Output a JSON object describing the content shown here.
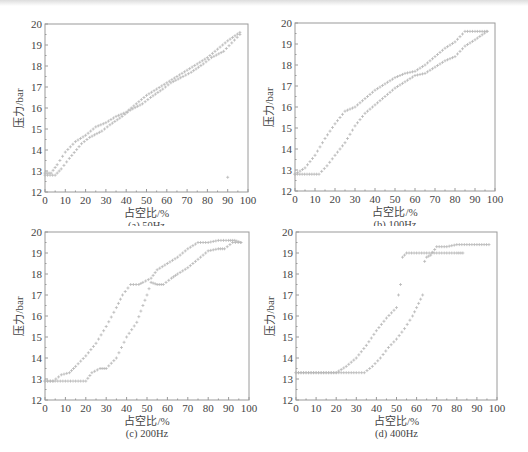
{
  "chart_data": [
    {
      "type": "scatter",
      "caption": "(a) 50Hz",
      "xlabel": "占空比/%",
      "ylabel": "压力/bar",
      "xlim": [
        0,
        100
      ],
      "ylim": [
        12,
        20
      ],
      "xticks": [
        0,
        10,
        20,
        30,
        40,
        50,
        60,
        70,
        80,
        90,
        100
      ],
      "yticks": [
        12,
        13,
        14,
        15,
        16,
        17,
        18,
        19,
        20
      ],
      "grid": false,
      "series": [
        {
          "name": "rising",
          "x": [
            0,
            3,
            6,
            10,
            15,
            20,
            25,
            30,
            35,
            40,
            45,
            50,
            55,
            60,
            65,
            70,
            75,
            80,
            85,
            90,
            96
          ],
          "y": [
            12.9,
            12.9,
            13.3,
            13.9,
            14.4,
            14.7,
            15.1,
            15.3,
            15.6,
            15.8,
            16.2,
            16.6,
            16.9,
            17.2,
            17.5,
            17.8,
            18.1,
            18.4,
            18.8,
            19.2,
            19.6
          ]
        },
        {
          "name": "falling",
          "x": [
            0,
            5,
            8,
            12,
            18,
            22,
            28,
            32,
            38,
            42,
            48,
            52,
            58,
            62,
            68,
            72,
            78,
            82,
            88,
            92,
            96
          ],
          "y": [
            12.8,
            12.8,
            13.1,
            13.6,
            14.3,
            14.6,
            14.9,
            15.2,
            15.6,
            15.9,
            16.2,
            16.5,
            16.9,
            17.2,
            17.5,
            17.7,
            18.1,
            18.4,
            18.7,
            19.1,
            19.5
          ]
        },
        {
          "name": "outlier",
          "x": [
            90
          ],
          "y": [
            12.7
          ]
        }
      ]
    },
    {
      "type": "scatter",
      "caption": "(b) 100Hz",
      "xlabel": "占空比/%",
      "ylabel": "压力/bar",
      "xlim": [
        0,
        100
      ],
      "ylim": [
        12,
        20
      ],
      "xticks": [
        0,
        10,
        20,
        30,
        40,
        50,
        60,
        70,
        80,
        90,
        100
      ],
      "yticks": [
        12,
        13,
        14,
        15,
        16,
        17,
        18,
        19,
        20
      ],
      "grid": false,
      "series": [
        {
          "name": "upper",
          "x": [
            0,
            5,
            10,
            15,
            20,
            25,
            30,
            35,
            40,
            45,
            50,
            55,
            60,
            65,
            70,
            75,
            80,
            85,
            90,
            96
          ],
          "y": [
            12.8,
            13.1,
            13.7,
            14.5,
            15.2,
            15.8,
            16.0,
            16.4,
            16.8,
            17.1,
            17.4,
            17.6,
            17.7,
            18.0,
            18.4,
            18.8,
            19.1,
            19.6,
            19.6,
            19.6
          ]
        },
        {
          "name": "lower",
          "x": [
            0,
            6,
            12,
            16,
            20,
            25,
            30,
            35,
            40,
            45,
            50,
            55,
            60,
            65,
            70,
            75,
            80,
            85,
            90,
            96
          ],
          "y": [
            12.8,
            12.8,
            12.8,
            13.2,
            13.7,
            14.3,
            15.1,
            15.7,
            16.1,
            16.5,
            16.9,
            17.2,
            17.5,
            17.6,
            17.9,
            18.2,
            18.4,
            18.9,
            19.2,
            19.6
          ]
        }
      ]
    },
    {
      "type": "scatter",
      "caption": "(c) 200Hz",
      "xlabel": "占空比/%",
      "ylabel": "压力/bar",
      "xlim": [
        0,
        100
      ],
      "ylim": [
        12,
        20
      ],
      "xticks": [
        0,
        10,
        20,
        30,
        40,
        50,
        60,
        70,
        80,
        90,
        100
      ],
      "yticks": [
        12,
        13,
        14,
        15,
        16,
        17,
        18,
        19,
        20
      ],
      "grid": false,
      "series": [
        {
          "name": "upper",
          "x": [
            0,
            4,
            8,
            12,
            15,
            20,
            25,
            30,
            35,
            38,
            42,
            46,
            48,
            52,
            55,
            60,
            65,
            70,
            75,
            80,
            85,
            90,
            93,
            96
          ],
          "y": [
            12.9,
            12.9,
            13.2,
            13.3,
            13.6,
            14.1,
            14.7,
            15.5,
            16.4,
            17.0,
            17.5,
            17.5,
            17.6,
            17.8,
            18.2,
            18.5,
            18.8,
            19.2,
            19.5,
            19.5,
            19.6,
            19.6,
            19.6,
            19.5
          ]
        },
        {
          "name": "lower",
          "x": [
            0,
            5,
            10,
            15,
            20,
            23,
            27,
            30,
            35,
            40,
            45,
            48,
            50,
            52,
            55,
            58,
            62,
            65,
            70,
            75,
            80,
            85,
            88,
            92,
            96
          ],
          "y": [
            12.9,
            12.9,
            12.9,
            12.9,
            12.9,
            13.3,
            13.5,
            13.5,
            14.0,
            15.0,
            15.7,
            16.5,
            17.0,
            17.6,
            17.5,
            17.5,
            17.8,
            18.0,
            18.3,
            18.7,
            19.1,
            19.2,
            19.2,
            19.5,
            19.5
          ]
        }
      ]
    },
    {
      "type": "scatter",
      "caption": "(d) 400Hz",
      "xlabel": "占空比/%",
      "ylabel": "压力/bar",
      "xlim": [
        0,
        100
      ],
      "ylim": [
        12,
        20
      ],
      "xticks": [
        0,
        10,
        20,
        30,
        40,
        50,
        60,
        70,
        80,
        90,
        100
      ],
      "yticks": [
        12,
        13,
        14,
        15,
        16,
        17,
        18,
        19,
        20
      ],
      "grid": false,
      "series": [
        {
          "name": "upper",
          "x": [
            0,
            5,
            10,
            15,
            20,
            25,
            30,
            35,
            40,
            45,
            50,
            51,
            52,
            53,
            55,
            60,
            65,
            70,
            75,
            80,
            83
          ],
          "y": [
            13.3,
            13.3,
            13.3,
            13.3,
            13.3,
            13.6,
            14.0,
            14.6,
            15.3,
            15.9,
            16.4,
            17.0,
            17.5,
            18.8,
            19.0,
            19.0,
            19.0,
            19.0,
            19.0,
            19.0,
            19.0
          ]
        },
        {
          "name": "lower",
          "x": [
            0,
            10,
            20,
            30,
            34,
            38,
            42,
            46,
            50,
            54,
            58,
            61,
            63,
            64,
            65,
            67,
            70,
            75,
            80,
            85,
            90,
            96
          ],
          "y": [
            13.3,
            13.3,
            13.3,
            13.3,
            13.3,
            13.6,
            14.0,
            14.5,
            14.9,
            15.4,
            16.0,
            16.6,
            17.0,
            18.6,
            18.8,
            18.9,
            19.3,
            19.3,
            19.4,
            19.4,
            19.4,
            19.4
          ]
        }
      ]
    }
  ],
  "marker_color": "#b8b8b8",
  "axis_color": "#9a9a9a"
}
